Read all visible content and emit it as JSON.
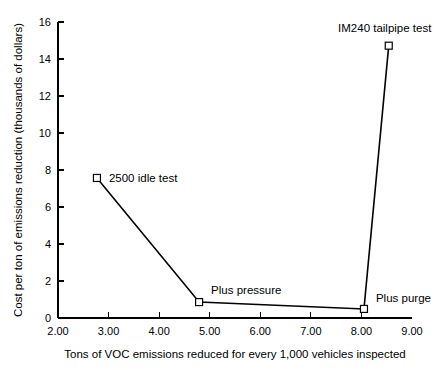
{
  "chart_data": {
    "type": "line",
    "title": "",
    "xlabel": "Tons of VOC emissions reduced for every 1,000 vehicles inspected",
    "ylabel": "Cost per ton of emissions reduction (thousands of dollars)",
    "xlim": [
      2.0,
      9.0
    ],
    "ylim": [
      0,
      16
    ],
    "xticks": [
      "2.00",
      "3.00",
      "4.00",
      "5.00",
      "6.00",
      "7.00",
      "8.00",
      "9.00"
    ],
    "xtick_values": [
      2.0,
      3.0,
      4.0,
      5.0,
      6.0,
      7.0,
      8.0,
      9.0
    ],
    "yticks": [
      "0",
      "2",
      "4",
      "6",
      "8",
      "10",
      "12",
      "14",
      "16"
    ],
    "ytick_values": [
      0,
      2,
      4,
      6,
      8,
      10,
      12,
      14,
      16
    ],
    "grid": false,
    "legend": "none",
    "line_color": "#000000",
    "marker_style": "open-square",
    "series": [
      {
        "name": "cost vs emissions reduced",
        "points": [
          {
            "label": "2500 idle test",
            "x": 2.77,
            "y": 7.57,
            "label_dx": 12,
            "label_dy": 4
          },
          {
            "label": "Plus pressure",
            "x": 4.79,
            "y": 0.86,
            "label_dx": 12,
            "label_dy": -8
          },
          {
            "label": "Plus purge",
            "x": 8.05,
            "y": 0.49,
            "label_dx": 12,
            "label_dy": -7
          },
          {
            "label": "IM240 tailpipe test",
            "x": 8.54,
            "y": 14.72,
            "label_dx": -4,
            "label_dy": -14
          }
        ]
      }
    ]
  },
  "plot_geometry": {
    "left": 58,
    "right": 412,
    "top": 22,
    "bottom": 318,
    "tick_length": 6,
    "marker_size": 7
  }
}
